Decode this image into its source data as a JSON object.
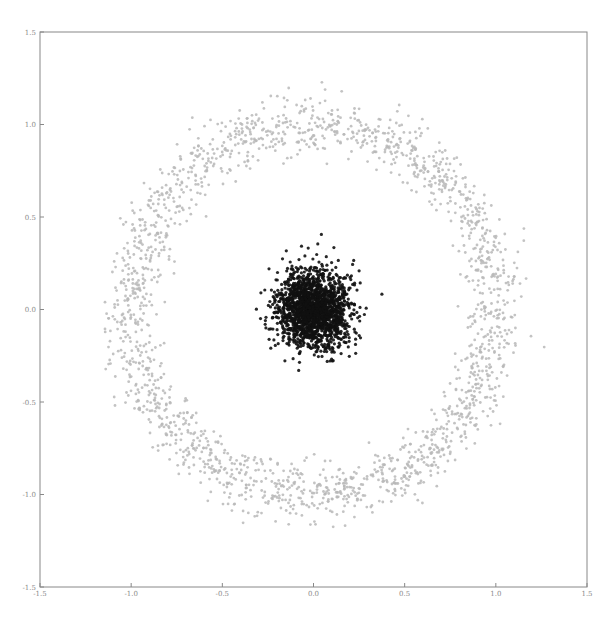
{
  "chart_data": {
    "type": "scatter",
    "title": "",
    "xlabel": "",
    "ylabel": "",
    "xlim": [
      -1.5,
      1.5
    ],
    "ylim": [
      -1.5,
      1.5
    ],
    "grid": false,
    "legend": null,
    "x_ticks": [
      "-1.5",
      "-1.0",
      "-0.5",
      "0.0",
      "0.5",
      "1.0",
      "1.5"
    ],
    "x_tick_values": [
      -1.5,
      -1.0,
      -0.5,
      0.0,
      0.5,
      1.0,
      1.5
    ],
    "y_ticks": [
      "-1.5",
      "-1.0",
      "-0.5",
      "0.0",
      "0.5",
      "1.0",
      "1.5"
    ],
    "y_tick_values": [
      -1.5,
      -1.0,
      -0.5,
      0.0,
      0.5,
      1.0,
      1.5
    ],
    "series": [
      {
        "name": "outer-ring",
        "shape": "ring",
        "color": "#b8b8b8",
        "center": [
          0.0,
          0.0
        ],
        "radius": 1.0,
        "noise_std": 0.075,
        "count": 2000,
        "seed": 7
      },
      {
        "name": "inner-cluster",
        "shape": "gaussian",
        "color": "#111111",
        "center": [
          0.0,
          0.0
        ],
        "std": 0.1,
        "count": 2000,
        "seed": 13
      }
    ]
  }
}
